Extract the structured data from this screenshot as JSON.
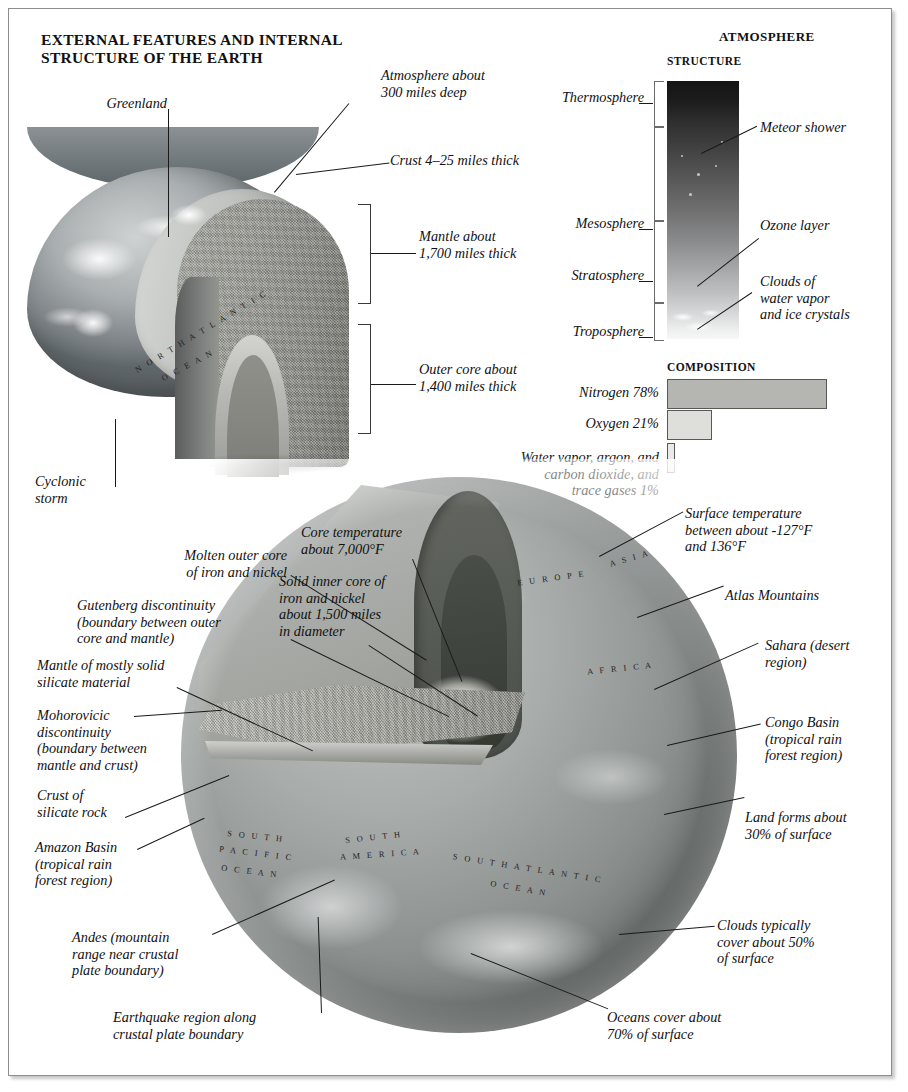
{
  "page": {
    "main_title": "EXTERNAL FEATURES AND INTERNAL STRUCTURE OF THE EARTH"
  },
  "main_title_lines": {
    "line1": "EXTERNAL FEATURES AND INTERNAL",
    "line2": "STRUCTURE OF THE EARTH"
  },
  "upper_diagram": {
    "callouts": {
      "greenland": "Greenland",
      "atmosphere": "Atmosphere about\n300 miles deep",
      "atmosphere_l1": "Atmosphere about",
      "atmosphere_l2": "300 miles deep",
      "crust": "Crust 4–25 miles thick",
      "mantle_l1": "Mantle about",
      "mantle_l2": "1,700 miles thick",
      "outer_core_l1": "Outer core about",
      "outer_core_l2": "1,400 miles thick",
      "cyclonic_l1": "Cyclonic",
      "cyclonic_l2": "storm"
    },
    "map_labels": [
      {
        "text": "N O R T H   A T L A N T I C",
        "name": "north-atlantic"
      },
      {
        "text": "O C E A N",
        "name": "ocean"
      }
    ]
  },
  "atmosphere_panel": {
    "section_title": "ATMOSPHERE",
    "structure_title": "STRUCTURE",
    "composition_title": "COMPOSITION",
    "layers": [
      {
        "name": "Thermosphere"
      },
      {
        "name": "Mesosphere"
      },
      {
        "name": "Stratosphere"
      },
      {
        "name": "Troposphere"
      }
    ],
    "annotations": {
      "meteor": "Meteor shower",
      "ozone": "Ozone layer",
      "clouds_l1": "Clouds of",
      "clouds_l2": "water vapor",
      "clouds_l3": "and ice crystals"
    }
  },
  "chart_data": {
    "type": "bar",
    "title": "COMPOSITION",
    "orientation": "horizontal",
    "categories": [
      "Nitrogen 78%",
      "Oxygen 21%",
      "Water vapor, argon, and carbon dioxide, and trace gases 1%"
    ],
    "values": [
      78,
      21,
      1
    ],
    "unit": "%",
    "xlabel": "",
    "ylabel": "",
    "xlim": [
      0,
      78
    ],
    "grid": false,
    "legend": false,
    "bar_labels": [
      {
        "label": "Nitrogen 78%",
        "value": 78,
        "fill": "#b5b6b1"
      },
      {
        "label_l1": "Oxygen 21%",
        "label": "Oxygen 21%",
        "value": 21,
        "fill": "#dedfda"
      },
      {
        "label": "Water vapor, argon, and carbon dioxide, and trace gases 1%",
        "label_l1": "Water vapor, argon, and",
        "label_l2": "carbon dioxide, and",
        "label_l3": "trace gases 1%",
        "value": 1,
        "fill": "#e9eae6"
      }
    ]
  },
  "lower_diagram": {
    "left_callouts": {
      "molten_outer_core_l1": "Molten outer core",
      "molten_outer_core_l2": "of iron and nickel",
      "gutenberg_l1": "Gutenberg discontinuity",
      "gutenberg_l2": "(boundary between outer",
      "gutenberg_l3": "core and mantle)",
      "mantle_l1": "Mantle of mostly solid",
      "mantle_l2": "silicate material",
      "moho_l1": "Mohorovicic",
      "moho_l2": "discontinuity",
      "moho_l3": "(boundary between",
      "moho_l4": "mantle and crust)",
      "crust_l1": "Crust of",
      "crust_l2": "silicate rock",
      "amazon_l1": "Amazon Basin",
      "amazon_l2": "(tropical rain",
      "amazon_l3": "forest region)",
      "andes_l1": "Andes (mountain",
      "andes_l2": "range near crustal",
      "andes_l3": "plate boundary)",
      "earthquake_l1": "Earthquake region along",
      "earthquake_l2": "crustal plate boundary"
    },
    "center_callouts": {
      "core_temp_l1": "Core temperature",
      "core_temp_l2": "about 7,000°F",
      "inner_core_l1": "Solid inner core of",
      "inner_core_l2": "iron and nickel",
      "inner_core_l3": "about 1,500 miles",
      "inner_core_l4": "in diameter"
    },
    "right_callouts": {
      "surface_temp_l1": "Surface temperature",
      "surface_temp_l2": "between about -127°F",
      "surface_temp_l3": "and 136°F",
      "atlas": "Atlas Mountains",
      "sahara_l1": "Sahara (desert",
      "sahara_l2": "region)",
      "congo_l1": "Congo Basin",
      "congo_l2": "(tropical rain",
      "congo_l3": "forest region)",
      "land_l1": "Land forms about",
      "land_l2": "30% of surface",
      "clouds_l1": "Clouds typically",
      "clouds_l2": "cover about 50%",
      "clouds_l3": "of surface",
      "oceans_l1": "Oceans cover about",
      "oceans_l2": "70% of surface"
    },
    "map_labels": {
      "europe": "E U R O P E",
      "asia": "A S I A",
      "africa": "A F R I C A",
      "south_pacific_l1": "S O U T H",
      "south_pacific_l2": "P A C I F I C",
      "south_pacific_l3": "O C E A N",
      "south_america_l1": "S O U T H",
      "south_america_l2": "A M E R I C A",
      "south_atlantic_l1": "S O U T H   A T L A N T I C",
      "south_atlantic_l2": "O C E A N"
    }
  },
  "colors": {
    "ink": "#111111",
    "leader_line": "#1a1a1a",
    "frame_border": "#8d8d8d",
    "bar_nitrogen": "#b5b6b1",
    "bar_oxygen": "#dedfda",
    "bar_trace": "#e9eae6"
  }
}
